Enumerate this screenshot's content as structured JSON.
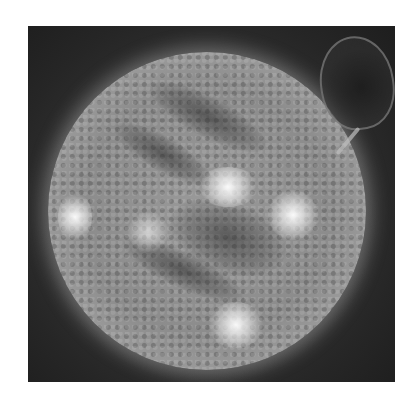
{
  "image": {
    "subject": "Sun disc with solar prominence (grayscale)",
    "colors": {
      "background": "#ffffff",
      "sky": "#262626",
      "disc": "#9a9a9a",
      "highlight": "#ffffff"
    }
  }
}
